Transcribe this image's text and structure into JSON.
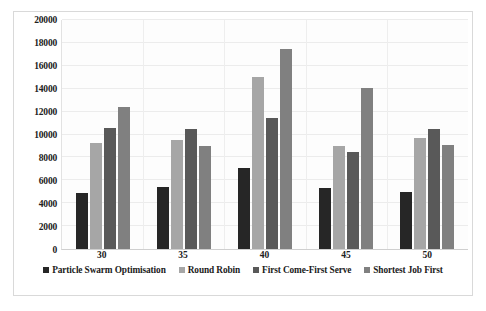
{
  "chart_data": {
    "type": "bar",
    "title": "",
    "subtitle": "",
    "xlabel": "",
    "ylabel": "",
    "categories": [
      "30",
      "35",
      "40",
      "45",
      "50"
    ],
    "series": [
      {
        "name": "Particle Swarm Optimisation",
        "color": "#262626",
        "values": [
          4900,
          5400,
          7100,
          5300,
          5000
        ]
      },
      {
        "name": "Round Robin",
        "color": "#a6a6a6",
        "values": [
          9300,
          9500,
          15000,
          9000,
          9700
        ]
      },
      {
        "name": "First Come-First Serve",
        "color": "#595959",
        "values": [
          10600,
          10500,
          11400,
          8500,
          10500
        ]
      },
      {
        "name": "Shortest Job First",
        "color": "#808080",
        "values": [
          12400,
          9000,
          17500,
          14100,
          9100
        ]
      }
    ],
    "ylim": [
      0,
      20000
    ],
    "y_ticks": [
      "20000",
      "18000",
      "16000",
      "14000",
      "12000",
      "10000",
      "8000",
      "6000",
      "4000",
      "2000",
      "0"
    ],
    "y_tick_values": [
      20000,
      18000,
      16000,
      14000,
      12000,
      10000,
      8000,
      6000,
      4000,
      2000,
      0
    ],
    "grid": true,
    "grid_axis": "both",
    "legend_position": "bottom",
    "bar_orientation": "vertical",
    "group_count": 5,
    "series_count": 4
  },
  "figure": {
    "background_color": "#ffffff",
    "plot_background_color": "#fdfdfd",
    "border_color": "#d9d9d9",
    "gridline_color": "#ececec"
  }
}
